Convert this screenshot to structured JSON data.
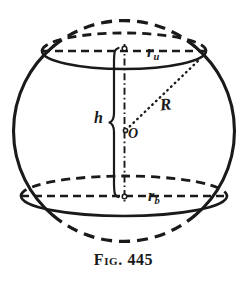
{
  "figure": {
    "caption": "Fig. 445",
    "ink_color": "#1a1a1a",
    "background_color": "#ffffff",
    "labels": {
      "upper_radius": {
        "symbol": "r",
        "subscript": "u"
      },
      "lower_radius": {
        "symbol": "r",
        "subscript": "b"
      },
      "height": {
        "symbol": "h"
      },
      "sphere_radius": {
        "symbol": "R"
      },
      "center": {
        "symbol": "O"
      }
    }
  },
  "geometry": {
    "sphere": {
      "cx": 124,
      "cy": 131,
      "r": 110
    },
    "upper_circle": {
      "cx": 124,
      "cy": 51,
      "rx": 82,
      "ry": 18
    },
    "lower_circle": {
      "cx": 124,
      "cy": 196,
      "rx": 103,
      "ry": 20
    },
    "axis": {
      "x": 124,
      "y_top": 48,
      "y_bottom": 198
    },
    "radius_line": {
      "x1": 126,
      "y1": 131,
      "x2": 198,
      "y2": 61
    },
    "height_brace": {
      "x": 113,
      "y_top": 48,
      "y_bottom": 197
    }
  }
}
